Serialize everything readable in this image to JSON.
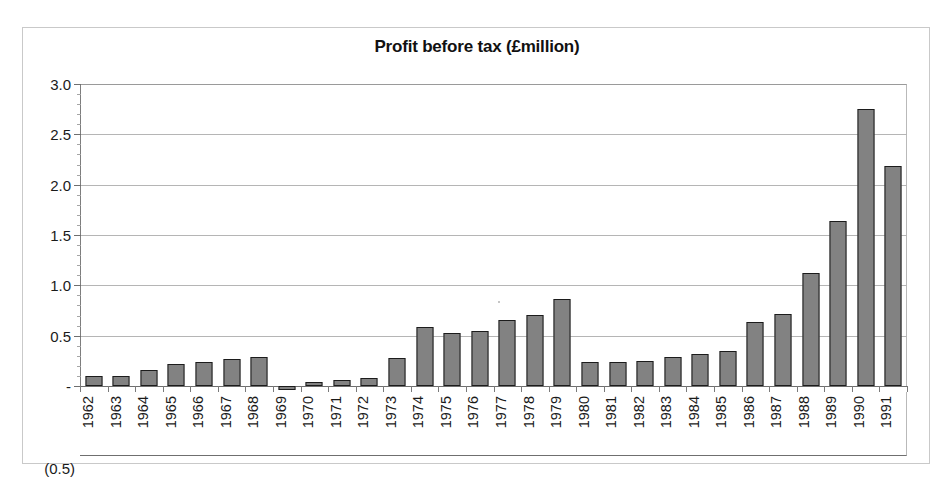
{
  "chart_data": {
    "type": "bar",
    "title": "Profit before tax (£million)",
    "xlabel": "",
    "ylabel": "",
    "ylim": [
      -0.5,
      3.0
    ],
    "ytick_labels": [
      "3.0",
      "2.5",
      "2.0",
      "1.5",
      "1.0",
      "0.5",
      "-",
      "(0.5)"
    ],
    "ytick_values": [
      3.0,
      2.5,
      2.0,
      1.5,
      1.0,
      0.5,
      0.0,
      -0.5
    ],
    "grid": true,
    "legend": "none",
    "categories": [
      "1962",
      "1963",
      "1964",
      "1965",
      "1966",
      "1967",
      "1968",
      "1969",
      "1970",
      "1971",
      "1972",
      "1973",
      "1974",
      "1975",
      "1976",
      "1977",
      "1978",
      "1979",
      "1980",
      "1981",
      "1982",
      "1983",
      "1984",
      "1985",
      "1986",
      "1987",
      "1988",
      "1989",
      "1990",
      "1991"
    ],
    "values": [
      0.1,
      0.1,
      0.16,
      0.22,
      0.24,
      0.27,
      0.29,
      -0.04,
      0.01,
      0.06,
      0.08,
      0.28,
      0.59,
      0.53,
      0.55,
      0.66,
      0.71,
      0.86,
      0.24,
      0.24,
      0.25,
      0.29,
      0.32,
      0.35,
      0.64,
      0.72,
      1.12,
      1.64,
      2.75,
      2.19
    ],
    "bar_fill_color": "#828282",
    "bar_border_color": "#1c1c1c",
    "gridline_color": "#b5b5b5",
    "axis_color": "#6f6f6f",
    "plot_background": "#ffffff"
  }
}
